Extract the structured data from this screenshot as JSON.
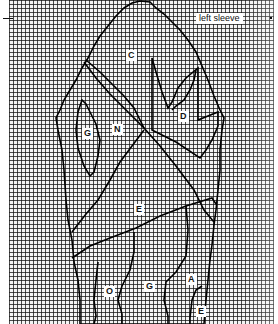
{
  "diagram": {
    "type": "knitting-chart",
    "title": "left sleeve",
    "grid_color": "#1a1a1a",
    "line_color": "#000000",
    "background_color": "#f4f4f4",
    "regions": [
      {
        "id": "C",
        "label": "C"
      },
      {
        "id": "D",
        "label": "D"
      },
      {
        "id": "G-upper",
        "label": "G"
      },
      {
        "id": "N",
        "label": "N"
      },
      {
        "id": "E-middle",
        "label": "E"
      },
      {
        "id": "O",
        "label": "O"
      },
      {
        "id": "G-lower",
        "label": "G"
      },
      {
        "id": "A",
        "label": "A"
      },
      {
        "id": "E-lower",
        "label": "E"
      }
    ]
  }
}
